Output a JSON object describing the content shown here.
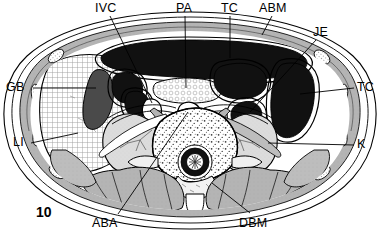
{
  "figure": {
    "number": "10",
    "type": "anatomical-cross-section",
    "region": "abdomen-axial-ct-schematic",
    "width": 381,
    "height": 237
  },
  "colors": {
    "outline": "#000000",
    "background": "#ffffff",
    "lumen_dark": "#111111",
    "gallbladder": "#4a4a4a",
    "muscle_gray": "#b5b5b5",
    "muscle_gray_dark": "#9a9a9a",
    "kidney_gray": "#d6d6d6",
    "fat_white": "#ffffff",
    "liver_stipple": "#e9e9e9",
    "bone_stipple": "#f2f2f2"
  },
  "labels": [
    {
      "id": "ivc",
      "text": "IVC",
      "x": 95,
      "y": 4,
      "anchor": "start",
      "leader": [
        [
          110,
          16
        ],
        [
          152,
          100
        ]
      ]
    },
    {
      "id": "pa",
      "text": "PA",
      "x": 177,
      "y": 4,
      "anchor": "start",
      "leader": [
        [
          185,
          16
        ],
        [
          185,
          86
        ]
      ]
    },
    {
      "id": "tc-top",
      "text": "TC",
      "x": 222,
      "y": 4,
      "anchor": "start",
      "leader": [
        [
          230,
          16
        ],
        [
          230,
          58
        ]
      ]
    },
    {
      "id": "abm",
      "text": "ABM",
      "x": 260,
      "y": 4,
      "anchor": "start",
      "leader": [
        [
          272,
          16
        ],
        [
          262,
          34
        ]
      ]
    },
    {
      "id": "je",
      "text": "JE",
      "x": 315,
      "y": 28,
      "anchor": "start",
      "leader": [
        [
          316,
          40
        ],
        [
          272,
          93
        ]
      ]
    },
    {
      "id": "tc-right",
      "text": "TC",
      "x": 358,
      "y": 82,
      "anchor": "start",
      "leader": [
        [
          356,
          88
        ],
        [
          306,
          88
        ]
      ]
    },
    {
      "id": "k",
      "text": "K",
      "x": 358,
      "y": 139,
      "anchor": "start",
      "leader": [
        [
          356,
          145
        ],
        [
          282,
          145
        ]
      ]
    },
    {
      "id": "gb",
      "text": "GB",
      "x": 8,
      "y": 82,
      "anchor": "start",
      "leader": [
        [
          32,
          88
        ],
        [
          92,
          88
        ]
      ]
    },
    {
      "id": "li",
      "text": "LI",
      "x": 14,
      "y": 137,
      "anchor": "start",
      "leader": [
        [
          30,
          143
        ],
        [
          74,
          136
        ]
      ]
    },
    {
      "id": "aba",
      "text": "ABA",
      "x": 93,
      "y": 219,
      "anchor": "start",
      "leader": [
        [
          118,
          218
        ],
        [
          188,
          112
        ]
      ]
    },
    {
      "id": "dbm",
      "text": "DBM",
      "x": 240,
      "y": 219,
      "anchor": "start",
      "leader": [
        [
          248,
          217
        ],
        [
          209,
          185
        ]
      ]
    }
  ],
  "label_glossary": {
    "IVC": "inferior vena cava",
    "PA": "pancreas",
    "TC": "transverse colon",
    "ABM": "abdominal muscles",
    "JE": "jejunum",
    "GB": "gallbladder",
    "LI": "liver",
    "K": "kidney",
    "ABA": "abdominal aorta",
    "DBM": "deep back muscles"
  }
}
